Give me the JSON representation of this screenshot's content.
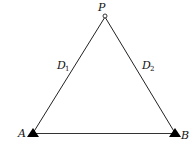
{
  "diagram": {
    "points": {
      "P": {
        "label": "P",
        "x": 105,
        "y": 16,
        "marker": "open-circle"
      },
      "A": {
        "label": "A",
        "x": 33,
        "y": 133,
        "marker": "filled-triangle"
      },
      "B": {
        "label": "B",
        "x": 175,
        "y": 133,
        "marker": "filled-triangle"
      }
    },
    "edges": [
      {
        "from": "A",
        "to": "P",
        "label": "D",
        "subscript": "1"
      },
      {
        "from": "B",
        "to": "P",
        "label": "D",
        "subscript": "2"
      },
      {
        "from": "A",
        "to": "B",
        "label": "",
        "subscript": ""
      }
    ],
    "colors": {
      "stroke": "#222222",
      "fill": "#000000",
      "background": "#ffffff"
    }
  }
}
